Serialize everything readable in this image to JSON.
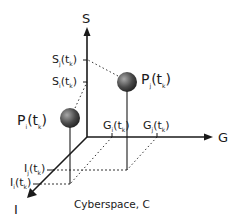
{
  "diagram": {
    "caption": "Cyberspace, C",
    "axes": {
      "s": {
        "label": "S"
      },
      "g": {
        "label": "G"
      },
      "i": {
        "label": "I"
      }
    },
    "points": [
      {
        "id": "pj",
        "label": "P",
        "sub": "j",
        "arg": "(t",
        "argsub": "k",
        "close": ")"
      },
      {
        "id": "pi",
        "label": "P",
        "sub": "i",
        "arg": "(t",
        "argsub": "k",
        "close": ")"
      }
    ],
    "ticks": {
      "s": [
        {
          "label": "S",
          "sub": "j",
          "arg": "(t",
          "argsub": "k",
          "close": ")"
        },
        {
          "label": "S",
          "sub": "i",
          "arg": "(t",
          "argsub": "k",
          "close": ")"
        }
      ],
      "g": [
        {
          "label": "G",
          "sub": "i",
          "arg": "(t",
          "argsub": "k",
          "close": ")"
        },
        {
          "label": "G",
          "sub": "j",
          "arg": "(t",
          "argsub": "k",
          "close": ")"
        }
      ],
      "i": [
        {
          "label": "I",
          "sub": "j",
          "arg": "(t",
          "argsub": "k",
          "close": ")"
        },
        {
          "label": "I",
          "sub": "i",
          "arg": "(t",
          "argsub": "k",
          "close": ")"
        }
      ]
    },
    "colors": {
      "line": "#1a1a1a",
      "ball_light": "#9a9a9a",
      "ball_dark": "#2a2a2a"
    }
  }
}
